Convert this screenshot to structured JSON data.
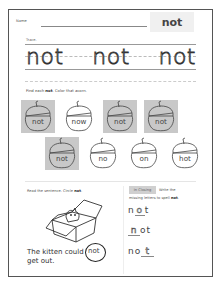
{
  "header": {
    "name_label": "Name",
    "title_word": "not"
  },
  "trace": {
    "label": "Trace.",
    "words": [
      "not",
      "not",
      "not"
    ]
  },
  "find": {
    "instruction_prefix": "Find each ",
    "instruction_bold": "not",
    "instruction_suffix": ". Color that acorn.",
    "acorns": [
      {
        "word": "not",
        "colored": true
      },
      {
        "word": "now",
        "colored": false
      },
      {
        "word": "not",
        "colored": true
      },
      {
        "word": "not",
        "colored": true
      },
      {
        "word": "not",
        "colored": true
      },
      {
        "word": "no",
        "colored": false
      },
      {
        "word": "on",
        "colored": false
      },
      {
        "word": "hot",
        "colored": false
      }
    ]
  },
  "read": {
    "instruction_prefix": "Read the sentence. Circle ",
    "instruction_bold": "not",
    "instruction_suffix": ".",
    "sentence_before": "The kitten could",
    "circled_word": "not",
    "sentence_after": "get out."
  },
  "write": {
    "tag": "In Closing",
    "instruction_line1": "Write the",
    "instruction_line2_prefix": "missing letters to spell ",
    "instruction_bold": "not",
    "instruction_suffix": ".",
    "rows": [
      {
        "before": "n",
        "blank": "o",
        "after": "t"
      },
      {
        "before": "",
        "blank": "n",
        "after": "ot"
      },
      {
        "before": "no",
        "blank": "t",
        "after": ""
      }
    ]
  },
  "colors": {
    "colored_acorn_bg": "#c8c8c8",
    "title_box_bg": "#f0f0f0",
    "border": "#555555"
  }
}
